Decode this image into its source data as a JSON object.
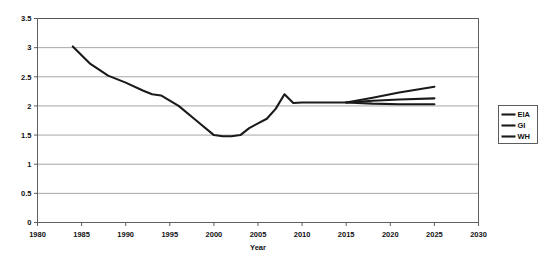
{
  "chart_data": {
    "type": "line",
    "title": "",
    "xlabel": "Year",
    "ylabel": "",
    "xlim": [
      1980,
      2030
    ],
    "ylim": [
      0,
      3.5
    ],
    "xticks": [
      1980,
      1985,
      1990,
      1995,
      2000,
      2005,
      2010,
      2015,
      2020,
      2025,
      2030
    ],
    "yticks": [
      0,
      0.5,
      1,
      1.5,
      2,
      2.5,
      3,
      3.5
    ],
    "xtick_labels": [
      "1980",
      "1985",
      "1990",
      "1995",
      "2000",
      "2005",
      "2010",
      "2015",
      "2020",
      "2025",
      "2030"
    ],
    "ytick_labels": [
      "0",
      "0.5",
      "1",
      "1.5",
      "2",
      "2.5",
      "3",
      "3.5"
    ],
    "grid": "horizontal",
    "legend_position": "right",
    "line_color": "#1a1a1a",
    "grid_color": "#808080",
    "axis_color": "#4d4d4d",
    "background": "#ffffff",
    "series": [
      {
        "name": "EIA",
        "x": [
          1984,
          1986,
          1988,
          1990,
          1992,
          1993,
          1994,
          1996,
          1998,
          2000,
          2001,
          2002,
          2003,
          2004,
          2005,
          2006,
          2007,
          2008,
          2009,
          2010,
          2012,
          2015,
          2018,
          2021,
          2025
        ],
        "values": [
          3.02,
          2.72,
          2.52,
          2.4,
          2.26,
          2.2,
          2.18,
          2.0,
          1.75,
          1.5,
          1.48,
          1.48,
          1.5,
          1.62,
          1.7,
          1.78,
          1.95,
          2.2,
          2.05,
          2.06,
          2.06,
          2.06,
          2.14,
          2.23,
          2.33
        ]
      },
      {
        "name": "GI",
        "x": [
          2015,
          2018,
          2021,
          2025
        ],
        "values": [
          2.06,
          2.09,
          2.11,
          2.13
        ]
      },
      {
        "name": "WH",
        "x": [
          2015,
          2018,
          2021,
          2025
        ],
        "values": [
          2.06,
          2.04,
          2.03,
          2.03
        ]
      }
    ],
    "legend_entries": [
      {
        "label": "EIA",
        "color": "#1a1a1a"
      },
      {
        "label": "GI",
        "color": "#1a1a1a"
      },
      {
        "label": "WH",
        "color": "#1a1a1a"
      }
    ]
  }
}
